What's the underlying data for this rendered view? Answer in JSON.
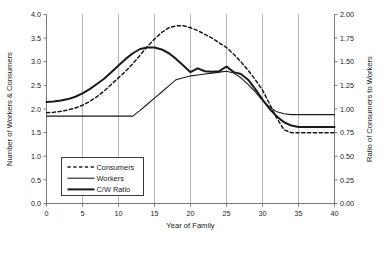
{
  "chart_data": {
    "type": "line",
    "title": "",
    "xlabel": "Year of Family",
    "ylabel": "Number of Workers & Consumers",
    "y2label": "Ratio of Consumers to Workers",
    "xlim": [
      0,
      40
    ],
    "ylim": [
      0.0,
      4.0
    ],
    "y2lim": [
      0.0,
      2.0
    ],
    "xticks": [
      0,
      5,
      10,
      15,
      20,
      25,
      30,
      35,
      40
    ],
    "xtick_labels": [
      "0",
      "5",
      "10",
      "15",
      "20",
      "25",
      "30",
      "35",
      "40"
    ],
    "yticks": [
      0.0,
      0.5,
      1.0,
      1.5,
      2.0,
      2.5,
      3.0,
      3.5,
      4.0
    ],
    "ytick_labels": [
      "0.0",
      "0.5",
      "1.0",
      "1.5",
      "2.0",
      "2.5",
      "3.0",
      "3.5",
      "4.0"
    ],
    "y2ticks": [
      0.0,
      0.25,
      0.5,
      0.75,
      1.0,
      1.25,
      1.5,
      1.75,
      2.0
    ],
    "y2tick_labels": [
      "0.00",
      "0.25",
      "0.50",
      "0.75",
      "1.00",
      "1.25",
      "1.50",
      "1.75",
      "2.00"
    ],
    "grid": "vertical-only",
    "gridlines_x": [
      5,
      10,
      15,
      20,
      25,
      30,
      35
    ],
    "legend_position": "lower-left-inside",
    "series": [
      {
        "name": "Consumers",
        "style": "dashed",
        "axis": "left",
        "color": "#1a1a1a",
        "x": [
          0,
          1,
          2,
          3,
          4,
          5,
          6,
          7,
          8,
          9,
          10,
          11,
          12,
          13,
          14,
          15,
          16,
          17,
          18,
          19,
          20,
          21,
          22,
          23,
          24,
          25,
          26,
          27,
          28,
          29,
          30,
          31,
          32,
          33,
          34,
          35,
          36,
          37,
          38,
          39,
          40
        ],
        "values": [
          1.92,
          1.93,
          1.95,
          1.98,
          2.02,
          2.08,
          2.16,
          2.26,
          2.38,
          2.52,
          2.66,
          2.8,
          2.96,
          3.14,
          3.32,
          3.48,
          3.62,
          3.72,
          3.76,
          3.76,
          3.72,
          3.66,
          3.58,
          3.5,
          3.4,
          3.3,
          3.16,
          3.0,
          2.82,
          2.62,
          2.4,
          2.1,
          1.8,
          1.56,
          1.5,
          1.5,
          1.5,
          1.5,
          1.5,
          1.5,
          1.5
        ]
      },
      {
        "name": "Workers",
        "style": "solid-thin",
        "axis": "left",
        "color": "#1a1a1a",
        "x": [
          0,
          1,
          2,
          3,
          4,
          5,
          6,
          7,
          8,
          9,
          10,
          11,
          12,
          13,
          14,
          15,
          16,
          17,
          18,
          19,
          20,
          21,
          22,
          23,
          24,
          25,
          26,
          27,
          28,
          29,
          30,
          31,
          32,
          33,
          34,
          35,
          36,
          37,
          38,
          39,
          40
        ],
        "values": [
          1.85,
          1.85,
          1.85,
          1.85,
          1.85,
          1.85,
          1.85,
          1.85,
          1.85,
          1.85,
          1.85,
          1.85,
          1.85,
          1.97,
          2.1,
          2.23,
          2.36,
          2.49,
          2.62,
          2.66,
          2.7,
          2.72,
          2.74,
          2.76,
          2.78,
          2.8,
          2.76,
          2.66,
          2.52,
          2.36,
          2.18,
          2.04,
          1.94,
          1.9,
          1.88,
          1.88,
          1.88,
          1.88,
          1.88,
          1.88,
          1.88
        ]
      },
      {
        "name": "C/W Ratio",
        "style": "solid-thick",
        "axis": "right",
        "color": "#1a1a1a",
        "x": [
          0,
          1,
          2,
          3,
          4,
          5,
          6,
          7,
          8,
          9,
          10,
          11,
          12,
          13,
          14,
          15,
          16,
          17,
          18,
          19,
          20,
          21,
          22,
          23,
          24,
          25,
          26,
          27,
          28,
          29,
          30,
          31,
          32,
          33,
          34,
          35,
          36,
          37,
          38,
          39,
          40
        ],
        "values_left_scale": [
          2.15,
          2.16,
          2.18,
          2.21,
          2.26,
          2.33,
          2.42,
          2.53,
          2.64,
          2.78,
          2.92,
          3.06,
          3.18,
          3.27,
          3.3,
          3.3,
          3.26,
          3.18,
          3.06,
          2.92,
          2.78,
          2.86,
          2.8,
          2.79,
          2.8,
          2.9,
          2.78,
          2.74,
          2.62,
          2.42,
          2.2,
          2.0,
          1.84,
          1.72,
          1.65,
          1.62,
          1.62,
          1.62,
          1.62,
          1.62,
          1.62
        ],
        "values": [
          1.075,
          1.08,
          1.09,
          1.105,
          1.13,
          1.165,
          1.21,
          1.265,
          1.32,
          1.39,
          1.46,
          1.53,
          1.59,
          1.635,
          1.65,
          1.65,
          1.63,
          1.59,
          1.53,
          1.46,
          1.39,
          1.43,
          1.4,
          1.395,
          1.4,
          1.45,
          1.39,
          1.37,
          1.31,
          1.21,
          1.1,
          1.0,
          0.92,
          0.86,
          0.825,
          0.81,
          0.81,
          0.81,
          0.81,
          0.81,
          0.81
        ]
      }
    ]
  },
  "legend": {
    "items": [
      {
        "label": "Consumers",
        "style": "dashed"
      },
      {
        "label": "Workers",
        "style": "solid-thin"
      },
      {
        "label": "C/W Ratio",
        "style": "solid-thick"
      }
    ]
  }
}
